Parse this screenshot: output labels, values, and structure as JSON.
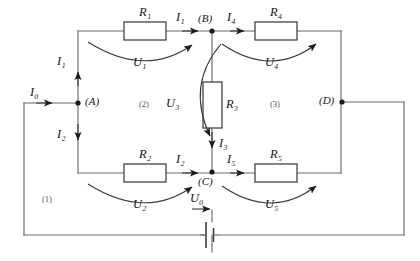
{
  "diagram": {
    "type": "electrical-circuit-schematic",
    "width": 420,
    "height": 261,
    "background_color": "#ffffff",
    "wire_color": "#6b6b6b",
    "ink_color": "#141414"
  },
  "resistors": [
    {
      "id": "R1",
      "base": "R",
      "sub": "1",
      "label": "R₁",
      "x": 145,
      "y": 15,
      "box": {
        "x": 124,
        "y": 22,
        "w": 42,
        "h": 18
      }
    },
    {
      "id": "R2",
      "base": "R",
      "sub": "2",
      "label": "R₂",
      "x": 145,
      "y": 157,
      "box": {
        "x": 124,
        "y": 164,
        "w": 42,
        "h": 18
      }
    },
    {
      "id": "R3",
      "base": "R",
      "sub": "3",
      "label": "R₃",
      "x": 227,
      "y": 99,
      "box": {
        "x": 203,
        "y": 82,
        "w": 19,
        "h": 46
      }
    },
    {
      "id": "R4",
      "base": "R",
      "sub": "4",
      "label": "R₄",
      "x": 276,
      "y": 15,
      "box": {
        "x": 255,
        "y": 22,
        "w": 42,
        "h": 18
      }
    },
    {
      "id": "R5",
      "base": "R",
      "sub": "5",
      "label": "R₅",
      "x": 276,
      "y": 157,
      "box": {
        "x": 255,
        "y": 164,
        "w": 42,
        "h": 18
      }
    }
  ],
  "voltages": [
    {
      "id": "U1",
      "base": "U",
      "sub": "1",
      "label": "U₁",
      "x": 141,
      "y": 57
    },
    {
      "id": "U2",
      "base": "U",
      "sub": "2",
      "label": "U₂",
      "x": 141,
      "y": 199
    },
    {
      "id": "U3",
      "base": "U",
      "sub": "3",
      "label": "U₃",
      "x": 171,
      "y": 98
    },
    {
      "id": "U4",
      "base": "U",
      "sub": "4",
      "label": "U₄",
      "x": 272,
      "y": 57
    },
    {
      "id": "U5",
      "base": "U",
      "sub": "5",
      "label": "U₅",
      "x": 272,
      "y": 199
    },
    {
      "id": "U0",
      "base": "U",
      "sub": "0",
      "label": "U₀",
      "x": 196,
      "y": 196
    }
  ],
  "currents": [
    {
      "id": "I0",
      "base": "I",
      "sub": "0",
      "label": "I₀",
      "x": 35,
      "y": 89,
      "direction": "right"
    },
    {
      "id": "I1_vertical",
      "base": "I",
      "sub": "1",
      "label": "I₁",
      "x": 60,
      "y": 58,
      "direction": "up"
    },
    {
      "id": "I1_top",
      "base": "I",
      "sub": "1",
      "label": "I₁",
      "x": 180,
      "y": 15,
      "direction": "right"
    },
    {
      "id": "I2_vertical",
      "base": "I",
      "sub": "2",
      "label": "I₂",
      "x": 60,
      "y": 131,
      "direction": "down"
    },
    {
      "id": "I2_bottom",
      "base": "I",
      "sub": "2",
      "label": "I₂",
      "x": 180,
      "y": 157,
      "direction": "right"
    },
    {
      "id": "I3",
      "base": "I",
      "sub": "3",
      "label": "I₃",
      "x": 220,
      "y": 140,
      "direction": "down"
    },
    {
      "id": "I4",
      "base": "I",
      "sub": "4",
      "label": "I₄",
      "x": 231,
      "y": 15,
      "direction": "right"
    },
    {
      "id": "I5",
      "base": "I",
      "sub": "5",
      "label": "I₅",
      "x": 231,
      "y": 157,
      "direction": "right"
    }
  ],
  "nodes": [
    {
      "id": "A",
      "label": "(A)",
      "x": 86,
      "y": 96,
      "dot_x": 78,
      "dot_y": 103
    },
    {
      "id": "B",
      "label": "(B)",
      "x": 203,
      "y": 15,
      "dot_x": 212,
      "dot_y": 31
    },
    {
      "id": "C",
      "label": "(C)",
      "x": 203,
      "y": 177,
      "dot_x": 212,
      "dot_y": 172
    },
    {
      "id": "D",
      "label": "(D)",
      "x": 320,
      "y": 95,
      "dot_x": 342,
      "dot_y": 102
    }
  ],
  "loops": [
    {
      "id": "loop1",
      "label": "(1)",
      "x": 42,
      "y": 195
    },
    {
      "id": "loop2",
      "label": "(2)",
      "x": 139,
      "y": 99
    },
    {
      "id": "loop3",
      "label": "(3)",
      "x": 272,
      "y": 99
    }
  ],
  "source": {
    "id": "U0-battery",
    "label": "U₀",
    "type": "dc-cell",
    "x": 212,
    "y": 235
  }
}
